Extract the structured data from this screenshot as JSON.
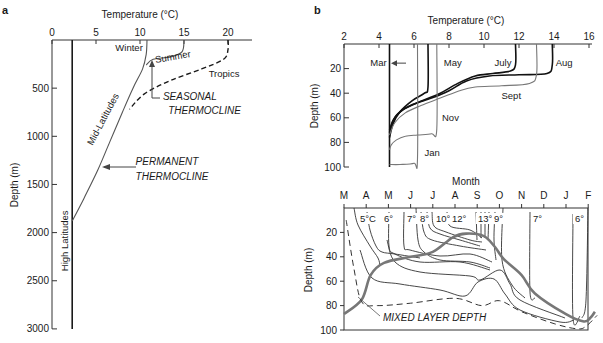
{
  "chart_data": [
    {
      "panel": "a",
      "type": "line",
      "title": "",
      "xlabel": "Temperature (°C)",
      "ylabel": "Depth (m)",
      "xlim": [
        0,
        22
      ],
      "ylim": [
        3000,
        0
      ],
      "xticks": [
        0,
        5,
        10,
        15,
        20
      ],
      "yticks": [
        0,
        500,
        1000,
        1500,
        2000,
        2500,
        3000
      ],
      "grid": false,
      "series": [
        {
          "name": "High Latitudes",
          "style": "solid-black",
          "points": [
            [
              2.3,
              0
            ],
            [
              2.3,
              3000
            ]
          ]
        },
        {
          "name": "Winter (Mid-Latitudes)",
          "style": "solid-gray",
          "points": [
            [
              10.8,
              0
            ],
            [
              10.7,
              150
            ],
            [
              10.3,
              300
            ],
            [
              9.2,
              500
            ],
            [
              8.0,
              750
            ],
            [
              6.6,
              1050
            ],
            [
              5.2,
              1350
            ],
            [
              3.6,
              1650
            ],
            [
              2.3,
              1880
            ]
          ]
        },
        {
          "name": "Summer (Mid-Latitudes)",
          "style": "solid-gray",
          "points": [
            [
              15,
              0
            ],
            [
              14.8,
              120
            ],
            [
              13.5,
              175
            ],
            [
              11.5,
              200
            ],
            [
              10.7,
              260
            ]
          ]
        },
        {
          "name": "Tropics",
          "style": "dashed-black",
          "points": [
            [
              20,
              0
            ],
            [
              20,
              100
            ],
            [
              19.5,
              200
            ],
            [
              17,
              300
            ],
            [
              13.5,
              420
            ],
            [
              10.5,
              560
            ],
            [
              8.8,
              720
            ]
          ]
        }
      ],
      "annotations": [
        {
          "text": "Winter",
          "x": 7.2,
          "y": 110
        },
        {
          "text": "Summer",
          "x": 11.8,
          "y": 240,
          "rotate": -10
        },
        {
          "text": "Tropics",
          "x": 17.8,
          "y": 380
        },
        {
          "text": "SEASONAL",
          "x": 12.6,
          "y": 620,
          "italic": true
        },
        {
          "text": "THERMOCLINE",
          "x": 13.2,
          "y": 770,
          "italic": true
        },
        {
          "text": "Mid-Latitudes",
          "x": 4.6,
          "y": 1100,
          "rotate": -62
        },
        {
          "text": "PERMANENT",
          "x": 9.5,
          "y": 1300,
          "italic": true
        },
        {
          "text": "THERMOCLINE",
          "x": 9.5,
          "y": 1450,
          "italic": true
        },
        {
          "text": "High Latitudes",
          "x": 1.8,
          "y": 2400,
          "rotate": -90
        }
      ]
    },
    {
      "panel": "b-top",
      "type": "line",
      "title": "",
      "xlabel": "Temperature (°C)",
      "ylabel": "Depth (m)",
      "xlim": [
        2,
        16
      ],
      "ylim": [
        100,
        0
      ],
      "xticks": [
        2,
        4,
        6,
        8,
        10,
        12,
        14,
        16
      ],
      "yticks": [
        20,
        40,
        60,
        80,
        100
      ],
      "grid": false,
      "series": [
        {
          "name": "Mar",
          "style": "black",
          "points": [
            [
              4.6,
              0
            ],
            [
              4.6,
              100
            ]
          ]
        },
        {
          "name": "May",
          "style": "black",
          "points": [
            [
              6.8,
              0
            ],
            [
              6.8,
              35
            ],
            [
              6.6,
              40
            ],
            [
              5.9,
              46
            ],
            [
              5.2,
              55
            ],
            [
              4.8,
              65
            ],
            [
              4.6,
              76
            ]
          ]
        },
        {
          "name": "July",
          "style": "black",
          "points": [
            [
              11.8,
              0
            ],
            [
              11.8,
              17
            ],
            [
              11.5,
              22
            ],
            [
              10.5,
              24
            ],
            [
              9.5,
              26
            ],
            [
              8.5,
              32
            ],
            [
              7.5,
              40
            ],
            [
              6.5,
              46
            ],
            [
              5.4,
              53
            ],
            [
              4.8,
              62
            ],
            [
              4.6,
              72
            ]
          ]
        },
        {
          "name": "Aug",
          "style": "black",
          "points": [
            [
              13.9,
              0
            ],
            [
              13.9,
              17
            ],
            [
              13.6,
              24
            ],
            [
              12,
              25
            ],
            [
              10.3,
              26
            ],
            [
              9.0,
              30
            ],
            [
              8.0,
              38
            ],
            [
              7.0,
              44
            ],
            [
              5.8,
              50
            ],
            [
              5.0,
              58
            ],
            [
              4.6,
              70
            ]
          ]
        },
        {
          "name": "Sept",
          "style": "gray",
          "points": [
            [
              13.0,
              0
            ],
            [
              13.0,
              25
            ],
            [
              12.6,
              32
            ],
            [
              11,
              34
            ],
            [
              9.5,
              35
            ],
            [
              8.6,
              38
            ],
            [
              7.5,
              44
            ],
            [
              6.4,
              50
            ],
            [
              5.5,
              56
            ],
            [
              4.9,
              64
            ],
            [
              4.6,
              74
            ]
          ]
        },
        {
          "name": "Nov",
          "style": "gray",
          "points": [
            [
              7.3,
              0
            ],
            [
              7.3,
              69
            ],
            [
              7.0,
              73
            ],
            [
              6.2,
              74
            ],
            [
              5.5,
              75
            ],
            [
              5.0,
              78
            ],
            [
              4.7,
              82
            ],
            [
              4.6,
              86
            ]
          ]
        },
        {
          "name": "Jan",
          "style": "gray",
          "points": [
            [
              6.2,
              0
            ],
            [
              6.2,
              93
            ],
            [
              6.0,
              97
            ],
            [
              5.2,
              98
            ],
            [
              4.6,
              98
            ]
          ]
        }
      ],
      "annotations": [
        {
          "text": "Mar",
          "x": 3.5,
          "y": 18
        },
        {
          "text": "May",
          "x": 7.7,
          "y": 18
        },
        {
          "text": "July",
          "x": 10.6,
          "y": 18
        },
        {
          "text": "Aug",
          "x": 14.1,
          "y": 18
        },
        {
          "text": "Sept",
          "x": 11.0,
          "y": 45
        },
        {
          "text": "Nov",
          "x": 7.6,
          "y": 63
        },
        {
          "text": "Jan",
          "x": 6.6,
          "y": 91
        }
      ]
    },
    {
      "panel": "b-bottom",
      "type": "line",
      "title": "",
      "xlabel": "Month",
      "ylabel": "Depth (m)",
      "xticks": [
        "M",
        "A",
        "M",
        "J",
        "J",
        "A",
        "S",
        "O",
        "N",
        "D",
        "J",
        "F"
      ],
      "yticks": [
        20,
        40,
        60,
        80,
        100
      ],
      "ylim": [
        100,
        0
      ],
      "grid": false,
      "isotherm_labels": [
        "5°C",
        "6°",
        "7°",
        "8°",
        "10°",
        "12°",
        "13°",
        "9°",
        "7°",
        "6°"
      ],
      "series": [
        {
          "name": "Mixed layer depth",
          "style": "thick-gray",
          "points": [
            [
              0,
              87
            ],
            [
              0.8,
              75
            ],
            [
              1.2,
              55
            ],
            [
              1.8,
              45
            ],
            [
              3.0,
              40
            ],
            [
              4.0,
              36
            ],
            [
              4.9,
              24
            ],
            [
              5.5,
              21
            ],
            [
              6.3,
              23
            ],
            [
              6.8,
              32
            ],
            [
              7.2,
              42
            ],
            [
              8.0,
              55
            ],
            [
              8.6,
              70
            ],
            [
              10.0,
              87
            ],
            [
              10.8,
              93
            ],
            [
              11.1,
              90
            ],
            [
              11.3,
              85
            ]
          ]
        },
        {
          "name": "Dashed boundary",
          "style": "dashed",
          "points": [
            [
              0.1,
              10
            ],
            [
              0.45,
              50
            ],
            [
              0.8,
              77
            ],
            [
              1.5,
              80
            ],
            [
              3.0,
              78
            ],
            [
              5.0,
              74
            ],
            [
              6.2,
              80
            ],
            [
              7.0,
              76
            ],
            [
              8.0,
              85
            ],
            [
              9.5,
              95
            ],
            [
              10.5,
              99
            ],
            [
              10.9,
              97
            ],
            [
              11.4,
              88
            ]
          ]
        }
      ],
      "annotations": [
        {
          "text": "MIXED LAYER DEPTH",
          "x_month_index": 1.6,
          "depth": 92,
          "italic": true
        }
      ]
    }
  ],
  "figure": {
    "panel_a_label": "a",
    "panel_b_label": "b",
    "a_xlabel": "Temperature (°C)",
    "a_ylabel": "Depth (m)",
    "b_top_xlabel": "Temperature (°C)",
    "b_top_ylabel": "Depth (m)",
    "b_bottom_xlabel": "Month",
    "b_bottom_ylabel": "Depth (m)"
  }
}
